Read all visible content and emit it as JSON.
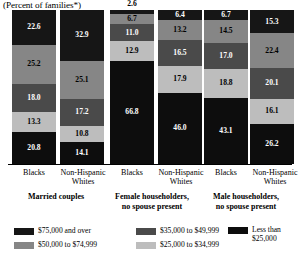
{
  "chart_data": {
    "type": "bar",
    "subtype": "100% stacked vertical bar",
    "title": "(Percent of families*)",
    "xlabel": "",
    "ylabel": "",
    "ylim": [
      0,
      100
    ],
    "grid": false,
    "legend_position": "bottom",
    "stack_order_top_to_bottom": [
      "$75,000 and over",
      "$50,000 to $74,999",
      "$35,000 to $49,999",
      "$25,000 to $34,999",
      "Less than $25,000"
    ],
    "groups": [
      "Married couples",
      "Female householders, no spouse present",
      "Male householders, no spouse present"
    ],
    "categories": [
      "Blacks",
      "Non-Hispanic Whites",
      "Blacks",
      "Non-Hispanic Whites",
      "Blacks",
      "Non-Hispanic Whites"
    ],
    "series": [
      {
        "name": "$75,000 and over",
        "color": "#161616",
        "values": [
          22.6,
          32.9,
          2.6,
          6.4,
          6.7,
          15.3
        ]
      },
      {
        "name": "$50,000 to $74,999",
        "color": "#868686",
        "values": [
          25.2,
          25.1,
          6.7,
          13.2,
          14.5,
          22.4
        ]
      },
      {
        "name": "$35,000 to $49,999",
        "color": "#4a4a4a",
        "values": [
          18.0,
          17.2,
          11.0,
          16.5,
          17.0,
          20.1
        ]
      },
      {
        "name": "$25,000 to $34,999",
        "color": "#bdbdbd",
        "values": [
          13.3,
          10.8,
          12.9,
          17.9,
          18.8,
          16.1
        ]
      },
      {
        "name": "Less than $25,000",
        "color": "#0d0d0d",
        "values": [
          20.8,
          14.1,
          66.8,
          46.0,
          43.1,
          26.2
        ]
      }
    ],
    "external_labels": [
      {
        "bar_index": 2,
        "series": "$75,000 and over",
        "value": "2.6"
      }
    ]
  },
  "title": {
    "text": "(Percent of families*)"
  },
  "bars": [
    {
      "group": "Married couples",
      "category": "Blacks",
      "segments": [
        {
          "label": "22.6",
          "value": 22.6,
          "color": "#161616",
          "text_color": "#ffffff",
          "external": false
        },
        {
          "label": "25.2",
          "value": 25.2,
          "color": "#868686",
          "text_color": "#000000",
          "external": false
        },
        {
          "label": "18.0",
          "value": 18.0,
          "color": "#4a4a4a",
          "text_color": "#ffffff",
          "external": false
        },
        {
          "label": "13.3",
          "value": 13.3,
          "color": "#bdbdbd",
          "text_color": "#000000",
          "external": false
        },
        {
          "label": "20.8",
          "value": 20.8,
          "color": "#0d0d0d",
          "text_color": "#ffffff",
          "external": false
        }
      ]
    },
    {
      "group": "Married couples",
      "category": "Non-Hispanic Whites",
      "segments": [
        {
          "label": "32.9",
          "value": 32.9,
          "color": "#161616",
          "text_color": "#ffffff",
          "external": false
        },
        {
          "label": "25.1",
          "value": 25.1,
          "color": "#868686",
          "text_color": "#000000",
          "external": false
        },
        {
          "label": "17.2",
          "value": 17.2,
          "color": "#4a4a4a",
          "text_color": "#ffffff",
          "external": false
        },
        {
          "label": "10.8",
          "value": 10.8,
          "color": "#bdbdbd",
          "text_color": "#000000",
          "external": false
        },
        {
          "label": "14.1",
          "value": 14.1,
          "color": "#0d0d0d",
          "text_color": "#ffffff",
          "external": false
        }
      ]
    },
    {
      "group": "Female householders, no spouse present",
      "category": "Blacks",
      "segments": [
        {
          "label": "2.6",
          "value": 2.6,
          "color": "#161616",
          "text_color": "#000000",
          "external": true
        },
        {
          "label": "6.7",
          "value": 6.7,
          "color": "#868686",
          "text_color": "#000000",
          "external": false
        },
        {
          "label": "11.0",
          "value": 11.0,
          "color": "#4a4a4a",
          "text_color": "#ffffff",
          "external": false
        },
        {
          "label": "12.9",
          "value": 12.9,
          "color": "#bdbdbd",
          "text_color": "#000000",
          "external": false
        },
        {
          "label": "66.8",
          "value": 66.8,
          "color": "#0d0d0d",
          "text_color": "#ffffff",
          "external": false
        }
      ]
    },
    {
      "group": "Female householders, no spouse present",
      "category": "Non-Hispanic Whites",
      "segments": [
        {
          "label": "6.4",
          "value": 6.4,
          "color": "#161616",
          "text_color": "#ffffff",
          "external": false
        },
        {
          "label": "13.2",
          "value": 13.2,
          "color": "#868686",
          "text_color": "#000000",
          "external": false
        },
        {
          "label": "16.5",
          "value": 16.5,
          "color": "#4a4a4a",
          "text_color": "#ffffff",
          "external": false
        },
        {
          "label": "17.9",
          "value": 17.9,
          "color": "#bdbdbd",
          "text_color": "#000000",
          "external": false
        },
        {
          "label": "46.0",
          "value": 46.0,
          "color": "#0d0d0d",
          "text_color": "#ffffff",
          "external": false
        }
      ]
    },
    {
      "group": "Male householders, no spouse present",
      "category": "Blacks",
      "segments": [
        {
          "label": "6.7",
          "value": 6.7,
          "color": "#161616",
          "text_color": "#ffffff",
          "external": false
        },
        {
          "label": "14.5",
          "value": 14.5,
          "color": "#868686",
          "text_color": "#000000",
          "external": false
        },
        {
          "label": "17.0",
          "value": 17.0,
          "color": "#4a4a4a",
          "text_color": "#ffffff",
          "external": false
        },
        {
          "label": "18.8",
          "value": 18.8,
          "color": "#bdbdbd",
          "text_color": "#000000",
          "external": false
        },
        {
          "label": "43.1",
          "value": 43.1,
          "color": "#0d0d0d",
          "text_color": "#ffffff",
          "external": false
        }
      ]
    },
    {
      "group": "Male householders, no spouse present",
      "category": "Non-Hispanic Whites",
      "segments": [
        {
          "label": "15.3",
          "value": 15.3,
          "color": "#161616",
          "text_color": "#ffffff",
          "external": false
        },
        {
          "label": "22.4",
          "value": 22.4,
          "color": "#868686",
          "text_color": "#000000",
          "external": false
        },
        {
          "label": "20.1",
          "value": 20.1,
          "color": "#4a4a4a",
          "text_color": "#ffffff",
          "external": false
        },
        {
          "label": "16.1",
          "value": 16.1,
          "color": "#bdbdbd",
          "text_color": "#000000",
          "external": false
        },
        {
          "label": "26.2",
          "value": 26.2,
          "color": "#0d0d0d",
          "text_color": "#ffffff",
          "external": false
        }
      ]
    }
  ],
  "axis": {
    "category_labels": [
      "Blacks",
      "Non-Hispanic Whites",
      "Blacks",
      "Non-Hispanic Whites",
      "Blacks",
      "Non-Hispanic Whites"
    ],
    "group_labels": [
      "Married couples",
      "Female householders,\nno spouse present",
      "Male householders,\nno spouse present"
    ]
  },
  "legend": {
    "items": [
      {
        "label": "$75,000 and over",
        "color": "#161616"
      },
      {
        "label": "$50,000 to $74,999",
        "color": "#868686"
      },
      {
        "label": "$35,000 to $49,999",
        "color": "#4a4a4a"
      },
      {
        "label": "$25,000 to $34,999",
        "color": "#bdbdbd"
      },
      {
        "label": "Less than\n$25,000",
        "color": "#0d0d0d"
      }
    ]
  }
}
